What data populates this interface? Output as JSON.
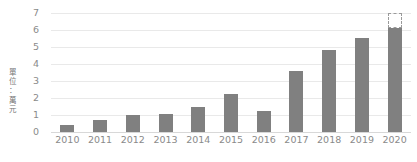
{
  "chart_data": {
    "type": "bar",
    "title": "",
    "subtitle": "",
    "xlabel": "",
    "ylabel": "單位：萬元",
    "categories": [
      "2010",
      "2011",
      "2012",
      "2013",
      "2014",
      "2015",
      "2016",
      "2017",
      "2018",
      "2019",
      "2020"
    ],
    "values": [
      0.4,
      0.7,
      1.0,
      1.05,
      1.5,
      2.25,
      1.25,
      3.6,
      4.8,
      5.55,
      6.1
    ],
    "projection": {
      "category": "2020",
      "from": 6.1,
      "to": 7.0,
      "style": "dashed-outline"
    },
    "ylim": [
      0,
      7
    ],
    "yticks": [
      0,
      1,
      2,
      3,
      4,
      5,
      6,
      7
    ],
    "ytick_labels": [
      "0",
      "1",
      "2",
      "3",
      "4",
      "5",
      "6",
      "7"
    ],
    "grid": true,
    "legend": "none",
    "series": [
      {
        "name": "",
        "values": [
          0.4,
          0.7,
          1.0,
          1.05,
          1.5,
          2.25,
          1.25,
          3.6,
          4.8,
          5.55,
          6.1
        ]
      }
    ]
  },
  "colors": {
    "bar": "#808080",
    "grid": "#e9e9e9",
    "axis": "#d8d8d8",
    "tick_text": "#8a8a8a",
    "unit_text": "#767676",
    "projection_outline": "#9a9a9a",
    "background": "#ffffff"
  },
  "axis": {
    "unit_label": "單位：萬元",
    "unit_label_chars": [
      "單",
      "位",
      "：",
      "萬",
      "元"
    ]
  },
  "footnote": {
    "text": ""
  }
}
